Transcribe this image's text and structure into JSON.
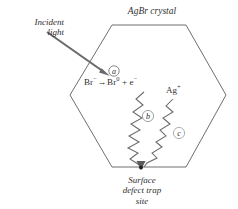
{
  "figure": {
    "title": "AgBr crystal",
    "background_color": "#ffffff",
    "line_color": "#5a5a5a",
    "text_color": "#2f2f2f",
    "labels": {
      "incident_light_line1": "Incident",
      "incident_light_line2": "light",
      "reaction_reactant": "Br",
      "reaction_reactant_charge": "−",
      "reaction_arrow": "→",
      "reaction_product_atom": "Br",
      "reaction_product_charge": "0",
      "reaction_plus": "+",
      "reaction_electron": "e",
      "reaction_electron_charge": "−",
      "silver_ion": "Ag",
      "silver_ion_charge": "+",
      "trap_line1": "Surface",
      "trap_line2": "defect trap",
      "trap_line3": "site"
    },
    "markers": {
      "a": "a",
      "b": "b",
      "c": "c"
    },
    "crystal_shape": "hexagon",
    "crystal_vertices": "112,25 186,25 226,95 186,167 112,167 70,95"
  }
}
